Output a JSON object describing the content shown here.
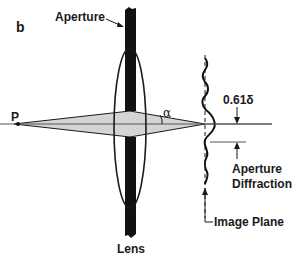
{
  "figure": {
    "panel_label": "b",
    "labels": {
      "aperture": "Aperture",
      "point": "P",
      "angle": "α",
      "lens": "Lens",
      "resolution": "0.61δ",
      "diffraction_line1": "Aperture",
      "diffraction_line2": "Diffraction",
      "image_plane": "Image Plane"
    },
    "colors": {
      "ink": "#1a1a1a",
      "cone_fill": "#d4d4d4",
      "background": "#ffffff"
    }
  }
}
